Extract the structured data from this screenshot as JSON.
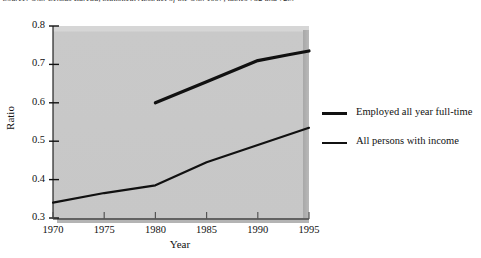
{
  "caption": {
    "source_note": "Source: U.S. Census Bureau, Statistical Abstract of the U.S. 1997, tables 752 and 723."
  },
  "chart_data": {
    "type": "line",
    "title": "",
    "xlabel": "Year",
    "ylabel": "Ratio",
    "xlim": [
      1970,
      1995
    ],
    "ylim": [
      0.3,
      0.8
    ],
    "xticks": [
      1970,
      1975,
      1980,
      1985,
      1990,
      1995
    ],
    "xtick_labels": [
      "1970",
      "1975",
      "1980",
      "1985",
      "1990",
      "1995"
    ],
    "yticks": [
      0.3,
      0.4,
      0.5,
      0.6,
      0.7,
      0.8
    ],
    "ytick_labels": [
      "0.3",
      "0.4",
      "0.5",
      "0.6",
      "0.7",
      "0.8"
    ],
    "grid": false,
    "legend_position": "right",
    "plot_background": "#c9c9c9",
    "line_color": "#111111",
    "series": [
      {
        "name": "Employed all year full-time",
        "stroke_width": 3.2,
        "x": [
          1980,
          1985,
          1990,
          1993,
          1995
        ],
        "values": [
          0.6,
          0.655,
          0.71,
          0.725,
          0.735
        ]
      },
      {
        "name": "All persons with income",
        "stroke_width": 2.2,
        "x": [
          1970,
          1975,
          1980,
          1985,
          1990,
          1995
        ],
        "values": [
          0.34,
          0.365,
          0.385,
          0.445,
          0.49,
          0.535
        ]
      }
    ]
  },
  "legend": {
    "items": [
      {
        "label": "Employed all year full-time"
      },
      {
        "label": "All persons with income"
      }
    ]
  }
}
